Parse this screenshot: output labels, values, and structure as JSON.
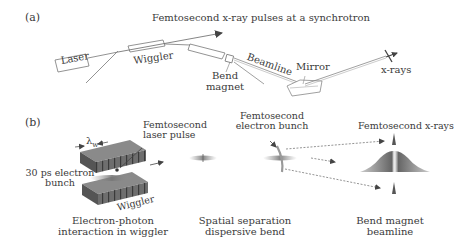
{
  "panel_a": {
    "label": "(a)",
    "title": "Femtosecond x-ray pulses at a synchrotron",
    "components": {
      "laser": "Laser",
      "wiggler": "Wiggler",
      "bend_magnet_line1": "Bend",
      "bend_magnet_line2": "magnet",
      "beamline": "Beamline",
      "mirror": "Mirror",
      "xrays": "x-rays"
    }
  },
  "panel_b": {
    "label": "(b)",
    "wiggler_stage": {
      "lambda_symbol": "λ",
      "lambda_subscript": "w",
      "laser_pulse_line1": "Femtosecond",
      "laser_pulse_line2": "laser pulse",
      "electron_bunch_line1": "30 ps electron",
      "electron_bunch_line2": "bunch",
      "wiggler": "Wiggler",
      "caption_line1": "Electron-photon",
      "caption_line2": "interaction in wiggler"
    },
    "separation_stage": {
      "bunch_line1": "Femtosecond",
      "bunch_line2": "electron bunch",
      "caption_line1": "Spatial separation",
      "caption_line2": "dispersive bend"
    },
    "beamline_stage": {
      "xrays_label": "Femtosecond x-rays",
      "caption_line1": "Bend magnet",
      "caption_line2": "beamline"
    }
  },
  "colors": {
    "line": "#6a6a6a",
    "text": "#3a3a3a",
    "magnet_dark": "#4a4a4a",
    "magnet_mid": "#7a7a7a"
  }
}
